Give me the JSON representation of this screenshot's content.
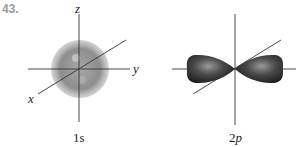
{
  "problem_number": "43.",
  "diagrams": [
    {
      "caption": "1s",
      "axes": {
        "z": "z",
        "y": "y",
        "x": "x"
      },
      "shape": "sphere"
    },
    {
      "caption_main": "2",
      "caption_sub": "p",
      "shape": "dumbbell"
    }
  ],
  "colors": {
    "sphere": "#8a8a8a",
    "lobe": "#3a3a3a",
    "axis": "#333333"
  }
}
